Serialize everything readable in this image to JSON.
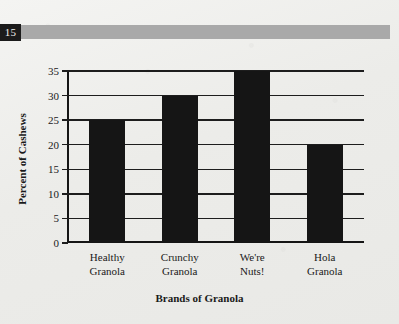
{
  "page": {
    "page_number": "15",
    "band_color": "#a9a9a9",
    "page_number_box_color": "#1b1b1b",
    "paper_color": "#eeeeec"
  },
  "chart_data": {
    "type": "bar",
    "title": "",
    "xlabel": "Brands of Granola",
    "ylabel": "Percent of Cashews",
    "categories": [
      "Healthy Granola",
      "Crunchy Granola",
      "We're Nuts!",
      "Hola Granola"
    ],
    "category_lines": [
      [
        "Healthy",
        "Granola"
      ],
      [
        "Crunchy",
        "Granola"
      ],
      [
        "We're",
        "Nuts!"
      ],
      [
        "Hola",
        "Granola"
      ]
    ],
    "values": [
      25,
      30,
      35,
      20
    ],
    "ylim": [
      0,
      35
    ],
    "ytick_step": 5,
    "yticks": [
      0,
      5,
      10,
      15,
      20,
      25,
      30,
      35
    ],
    "ytick_labels": [
      "0",
      "5",
      "10",
      "15",
      "20",
      "25",
      "30",
      "35"
    ],
    "grid": true,
    "grid_axis": "y",
    "legend": false,
    "bar_color": "#151515",
    "axis_color": "#151515"
  }
}
